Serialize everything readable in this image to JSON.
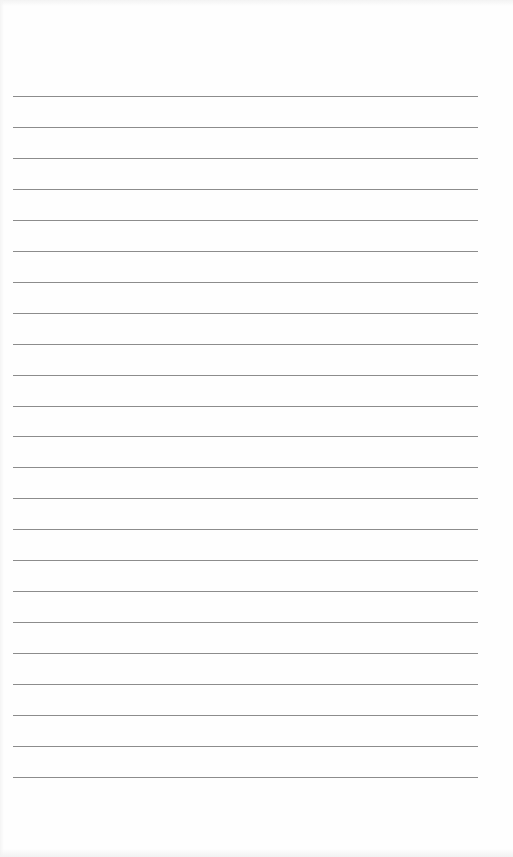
{
  "page": {
    "type": "lined-notepaper",
    "background_color": "#fefefe",
    "line_color": "#8c8c8c",
    "line_count": 23,
    "line_left_px": 13,
    "line_right_px": 478,
    "first_line_y_px": 96,
    "line_spacing_px": 30.95,
    "line_thickness_px": 1
  }
}
